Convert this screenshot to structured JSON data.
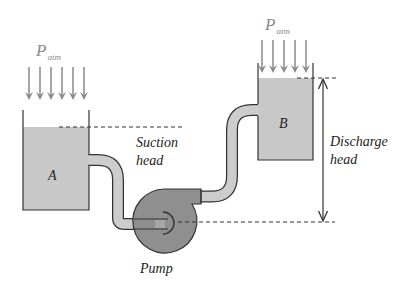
{
  "diagram": {
    "type": "pump system schematic",
    "tank_a": {
      "label": "A",
      "atmospheric_pressure_label": "P",
      "atmospheric_pressure_subscript": "atm"
    },
    "tank_b": {
      "label": "B",
      "atmospheric_pressure_label": "P",
      "atmospheric_pressure_subscript": "atm"
    },
    "suction_head": {
      "line1": "Suction",
      "line2": "head"
    },
    "discharge_head": {
      "line1": "Discharge",
      "line2": "head"
    },
    "pump": {
      "label": "Pump"
    },
    "colors": {
      "water": "#c8c8c8",
      "pipe_fill": "#cdcdcd",
      "pump_fill": "#8f8f8f",
      "outline": "#333333",
      "arrow_gray": "#8a8a8a",
      "text": "#222222"
    }
  }
}
